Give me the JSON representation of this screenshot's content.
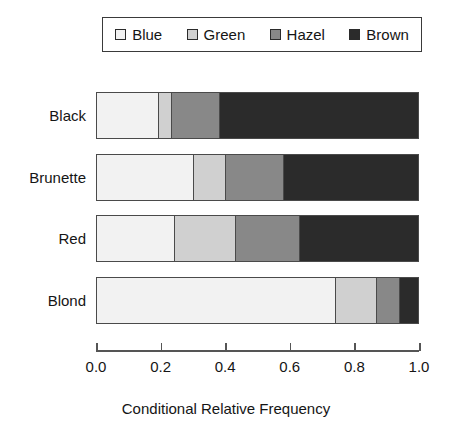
{
  "chart_data": {
    "type": "bar",
    "orientation": "horizontal",
    "stacked": true,
    "normalized": true,
    "title": "",
    "xlabel": "Conditional Relative Frequency",
    "ylabel": "",
    "xlim": [
      0.0,
      1.0
    ],
    "grid": false,
    "legend_position": "top",
    "categories": [
      "Black",
      "Brunette",
      "Red",
      "Blond"
    ],
    "tick_labels": [
      "0.0",
      "0.2",
      "0.4",
      "0.6",
      "0.8",
      "1.0"
    ],
    "tick_values": [
      0.0,
      0.2,
      0.4,
      0.6,
      0.8,
      1.0
    ],
    "series": [
      {
        "name": "Blue",
        "color": "#f2f2f2",
        "values": [
          0.19,
          0.3,
          0.24,
          0.74
        ]
      },
      {
        "name": "Green",
        "color": "#d0d0d0",
        "values": [
          0.04,
          0.1,
          0.19,
          0.13
        ]
      },
      {
        "name": "Hazel",
        "color": "#888888",
        "values": [
          0.15,
          0.18,
          0.2,
          0.07
        ]
      },
      {
        "name": "Brown",
        "color": "#2b2b2b",
        "values": [
          0.62,
          0.42,
          0.37,
          0.06
        ]
      }
    ]
  },
  "legend": {
    "entries": [
      {
        "label": "Blue"
      },
      {
        "label": "Green"
      },
      {
        "label": "Hazel"
      },
      {
        "label": "Brown"
      }
    ]
  },
  "axis": {
    "title": "Conditional Relative Frequency"
  }
}
